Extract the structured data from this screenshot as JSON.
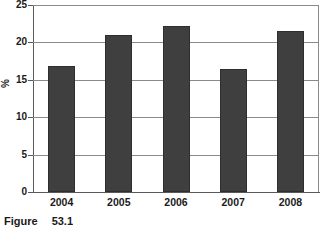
{
  "chart_data": {
    "type": "bar",
    "title": "",
    "xlabel": "",
    "ylabel": "%",
    "categories": [
      "2004",
      "2005",
      "2006",
      "2007",
      "2008"
    ],
    "values": [
      16.9,
      21.0,
      22.2,
      16.5,
      21.5
    ],
    "ylim": [
      0,
      25
    ],
    "yticks": [
      0,
      5,
      10,
      15,
      20,
      25
    ],
    "ytick_labels": [
      "0",
      "5",
      "10",
      "15",
      "20",
      "25"
    ],
    "grid": "horizontal",
    "legend": "none",
    "bar_color": "#3f3f3f",
    "grid_color": "#8a8a8a",
    "axis_color": "#595959",
    "background": "#ffffff"
  },
  "caption": {
    "label": "Figure",
    "number": "53.1"
  }
}
